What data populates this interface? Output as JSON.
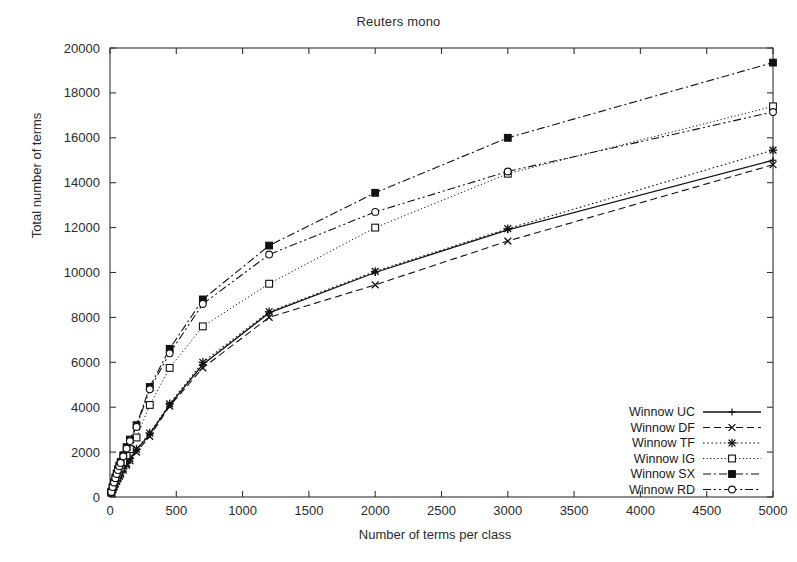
{
  "chart_data": {
    "type": "line",
    "title": "Reuters mono",
    "xlabel": "Number of terms per class",
    "ylabel": "Total number of terms",
    "xlim": [
      0,
      5000
    ],
    "ylim": [
      0,
      20000
    ],
    "xticks": [
      0,
      500,
      1000,
      1500,
      2000,
      2500,
      3000,
      3500,
      4000,
      4500,
      5000
    ],
    "yticks": [
      0,
      2000,
      4000,
      6000,
      8000,
      10000,
      12000,
      14000,
      16000,
      18000,
      20000
    ],
    "grid": false,
    "legend_position": "lower-right inside",
    "series": [
      {
        "name": "Winnow UC",
        "style": "solid",
        "marker": "plus",
        "x": [
          10,
          20,
          30,
          40,
          50,
          60,
          70,
          80,
          100,
          125,
          150,
          200,
          300,
          450,
          700,
          1200,
          2000,
          3000,
          5000
        ],
        "y": [
          180,
          330,
          470,
          600,
          720,
          840,
          950,
          1060,
          1250,
          1480,
          1700,
          2100,
          2800,
          4100,
          5900,
          8200,
          10000,
          11900,
          15000
        ]
      },
      {
        "name": "Winnow DF",
        "style": "dashed",
        "marker": "cross",
        "x": [
          10,
          20,
          30,
          40,
          50,
          60,
          70,
          80,
          100,
          125,
          150,
          200,
          300,
          450,
          700,
          1200,
          2000,
          3000,
          5000
        ],
        "y": [
          175,
          320,
          455,
          580,
          700,
          810,
          920,
          1020,
          1200,
          1420,
          1620,
          2000,
          2700,
          4050,
          5750,
          8000,
          9450,
          11400,
          14800
        ]
      },
      {
        "name": "Winnow TF",
        "style": "dotted-dash",
        "marker": "star",
        "x": [
          10,
          20,
          30,
          40,
          50,
          60,
          70,
          80,
          100,
          125,
          150,
          200,
          300,
          450,
          700,
          1200,
          2000,
          3000,
          5000
        ],
        "y": [
          185,
          340,
          480,
          610,
          735,
          855,
          965,
          1075,
          1270,
          1500,
          1720,
          2130,
          2850,
          4150,
          6000,
          8250,
          10050,
          11950,
          15450
        ]
      },
      {
        "name": "Winnow IG",
        "style": "dotted",
        "marker": "square-open",
        "x": [
          10,
          20,
          30,
          40,
          50,
          60,
          70,
          80,
          100,
          125,
          150,
          200,
          300,
          450,
          700,
          1200,
          2000,
          3000,
          5000
        ],
        "y": [
          200,
          380,
          560,
          720,
          880,
          1030,
          1170,
          1310,
          1560,
          1860,
          2130,
          2650,
          4100,
          5750,
          7600,
          9500,
          12000,
          14400,
          17400
        ]
      },
      {
        "name": "Winnow SX",
        "style": "dash-dot",
        "marker": "square-filled",
        "x": [
          10,
          20,
          30,
          40,
          50,
          60,
          70,
          80,
          100,
          125,
          150,
          200,
          300,
          450,
          700,
          1200,
          2000,
          3000,
          5000
        ],
        "y": [
          230,
          450,
          660,
          860,
          1050,
          1230,
          1400,
          1560,
          1860,
          2220,
          2560,
          3200,
          4900,
          6600,
          8800,
          11200,
          13550,
          16000,
          19350
        ]
      },
      {
        "name": "Winnow RD",
        "style": "dash-dot-dot",
        "marker": "circle-open",
        "x": [
          10,
          20,
          30,
          40,
          50,
          60,
          70,
          80,
          100,
          125,
          150,
          200,
          300,
          450,
          700,
          1200,
          2000,
          3000,
          5000
        ],
        "y": [
          225,
          440,
          645,
          840,
          1025,
          1200,
          1365,
          1520,
          1810,
          2160,
          2490,
          3120,
          4800,
          6400,
          8600,
          10800,
          12700,
          14500,
          17150
        ]
      }
    ]
  },
  "legend": {
    "items": [
      {
        "label": "Winnow UC"
      },
      {
        "label": "Winnow DF"
      },
      {
        "label": "Winnow TF"
      },
      {
        "label": "Winnow IG"
      },
      {
        "label": "Winnow SX"
      },
      {
        "label": "Winnow RD"
      }
    ]
  }
}
